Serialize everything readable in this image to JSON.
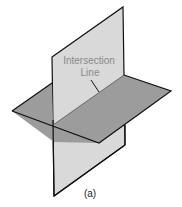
{
  "figure": {
    "caption": "(a)",
    "label_line1": "Intersection",
    "label_line2": "Line"
  },
  "colors": {
    "vertical_plane": "#d9d9d9",
    "horizontal_plane": "#9c9c9c",
    "edge": "#111111",
    "label": "#8a8a8a"
  },
  "geometry": {
    "vertical_plane": [
      [
        52,
        57
      ],
      [
        123,
        7
      ],
      [
        125,
        145
      ],
      [
        54,
        196
      ]
    ],
    "horizontal_plane": [
      [
        12,
        111
      ],
      [
        84,
        59
      ],
      [
        171,
        91
      ],
      [
        99,
        143
      ]
    ],
    "intersection_line": [
      [
        53,
        125
      ],
      [
        124,
        75
      ]
    ]
  }
}
